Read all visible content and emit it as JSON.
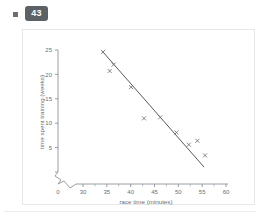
{
  "header": {
    "bullet_icon": "square-bullet-icon",
    "question_number": "43"
  },
  "chart_data": {
    "type": "scatter",
    "title": "",
    "xlabel": "race time (minutes)",
    "ylabel": "time spent training (weeks)",
    "xlim": [
      28,
      61
    ],
    "ylim": [
      0,
      26
    ],
    "x_ticks": [
      30,
      35,
      40,
      45,
      50,
      55,
      60
    ],
    "y_ticks": [
      0,
      5,
      10,
      15,
      20,
      25
    ],
    "origin_label": "0",
    "x_axis_break": true,
    "y_axis_break": true,
    "grid": false,
    "legend": "none",
    "marker": "x",
    "points": [
      {
        "x": 34.2,
        "y": 24.6
      },
      {
        "x": 36.4,
        "y": 22.0
      },
      {
        "x": 35.6,
        "y": 20.7
      },
      {
        "x": 40.1,
        "y": 17.4
      },
      {
        "x": 42.8,
        "y": 11.0
      },
      {
        "x": 46.2,
        "y": 11.2
      },
      {
        "x": 49.6,
        "y": 8.1
      },
      {
        "x": 52.2,
        "y": 5.6
      },
      {
        "x": 54.0,
        "y": 6.4
      },
      {
        "x": 55.6,
        "y": 3.4
      }
    ],
    "trend_line": {
      "type": "line-of-best-fit",
      "x_start": 34.0,
      "y_start": 24.8,
      "x_end": 55.4,
      "y_end": 1.0
    }
  }
}
